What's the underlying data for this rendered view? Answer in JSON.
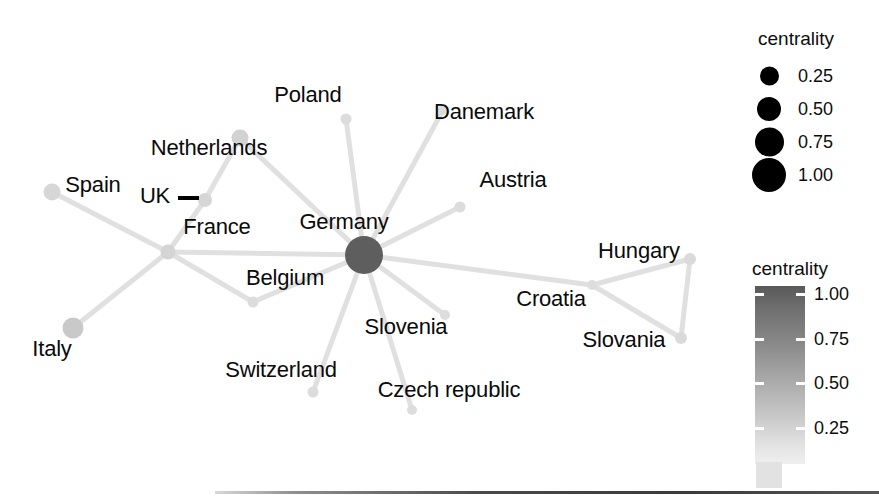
{
  "figure": {
    "type": "network-graph",
    "title": "",
    "background": "#ffffff"
  },
  "chart_data": {
    "type": "scatter",
    "subtype": "node-link-network",
    "title": "",
    "xlabel": "",
    "ylabel": "",
    "grid": false,
    "legend_position": "right",
    "encodings": {
      "node_size": "centrality",
      "node_color": "centrality"
    },
    "nodes": [
      {
        "id": "germany",
        "label": "Germany",
        "x": 364,
        "y": 255,
        "r": 19.0,
        "color": "#5e5e5e",
        "centrality": 1.0,
        "label_x": 344,
        "label_y": 222,
        "label_anchor": "middle"
      },
      {
        "id": "poland",
        "label": "Poland",
        "x": 346,
        "y": 119,
        "r": 5.5,
        "color": "#dcdcdc",
        "centrality": 0.15,
        "label_x": 308,
        "label_y": 95,
        "label_anchor": "middle"
      },
      {
        "id": "danemark",
        "label": "Danemark",
        "x": 443,
        "y": 110,
        "r": 5.0,
        "color": "#dddddd",
        "centrality": 0.13,
        "label_x": 484,
        "label_y": 112,
        "label_anchor": "middle"
      },
      {
        "id": "austria",
        "label": "Austria",
        "x": 460,
        "y": 207,
        "r": 5.5,
        "color": "#dcdcdc",
        "centrality": 0.15,
        "label_x": 513,
        "label_y": 180,
        "label_anchor": "middle"
      },
      {
        "id": "netherlands",
        "label": "Netherlands",
        "x": 240,
        "y": 138,
        "r": 8.5,
        "color": "#d2d2d2",
        "centrality": 0.26,
        "label_x": 209,
        "label_y": 148,
        "label_anchor": "middle"
      },
      {
        "id": "uk",
        "label": "UK",
        "x": 205,
        "y": 200,
        "r": 7.0,
        "color": "#d6d6d6",
        "centrality": 0.21,
        "label_x": 155,
        "label_y": 196,
        "label_anchor": "middle"
      },
      {
        "id": "france",
        "label": "France",
        "x": 168,
        "y": 252,
        "r": 7.5,
        "color": "#d4d4d4",
        "centrality": 0.23,
        "label_x": 217,
        "label_y": 227,
        "label_anchor": "middle"
      },
      {
        "id": "spain",
        "label": "Spain",
        "x": 52,
        "y": 192,
        "r": 8.5,
        "color": "#d6d6d6",
        "centrality": 0.22,
        "label_x": 93,
        "label_y": 185,
        "label_anchor": "middle"
      },
      {
        "id": "italy",
        "label": "Italy",
        "x": 73,
        "y": 328,
        "r": 10.5,
        "color": "#c9c9c9",
        "centrality": 0.31,
        "label_x": 52,
        "label_y": 349,
        "label_anchor": "middle"
      },
      {
        "id": "belgium",
        "label": "Belgium",
        "x": 253,
        "y": 302,
        "r": 5.5,
        "color": "#dcdcdc",
        "centrality": 0.15,
        "label_x": 285,
        "label_y": 278,
        "label_anchor": "middle"
      },
      {
        "id": "switzerland",
        "label": "Switzerland",
        "x": 313,
        "y": 392,
        "r": 5.5,
        "color": "#dcdcdc",
        "centrality": 0.15,
        "label_x": 281,
        "label_y": 370,
        "label_anchor": "middle"
      },
      {
        "id": "czech-republic",
        "label": "Czech republic",
        "x": 412,
        "y": 410,
        "r": 5.0,
        "color": "#dddddd",
        "centrality": 0.13,
        "label_x": 449,
        "label_y": 390,
        "label_anchor": "middle"
      },
      {
        "id": "slovenia",
        "label": "Slovenia",
        "x": 445,
        "y": 315,
        "r": 5.0,
        "color": "#dddddd",
        "centrality": 0.13,
        "label_x": 406,
        "label_y": 327,
        "label_anchor": "middle"
      },
      {
        "id": "croatia",
        "label": "Croatia",
        "x": 592,
        "y": 285,
        "r": 5.0,
        "color": "#dddddd",
        "centrality": 0.13,
        "label_x": 551,
        "label_y": 299,
        "label_anchor": "middle"
      },
      {
        "id": "hungary",
        "label": "Hungary",
        "x": 690,
        "y": 259,
        "r": 6.0,
        "color": "#dadada",
        "centrality": 0.17,
        "label_x": 639,
        "label_y": 251,
        "label_anchor": "middle"
      },
      {
        "id": "slovania",
        "label": "Slovania",
        "x": 681,
        "y": 338,
        "r": 6.0,
        "color": "#dadada",
        "centrality": 0.17,
        "label_x": 624,
        "label_y": 340,
        "label_anchor": "middle"
      }
    ],
    "edges": [
      {
        "source": "germany",
        "target": "poland"
      },
      {
        "source": "germany",
        "target": "danemark"
      },
      {
        "source": "germany",
        "target": "austria"
      },
      {
        "source": "germany",
        "target": "netherlands"
      },
      {
        "source": "germany",
        "target": "france"
      },
      {
        "source": "germany",
        "target": "belgium"
      },
      {
        "source": "germany",
        "target": "switzerland"
      },
      {
        "source": "germany",
        "target": "czech-republic"
      },
      {
        "source": "germany",
        "target": "slovenia"
      },
      {
        "source": "germany",
        "target": "croatia"
      },
      {
        "source": "netherlands",
        "target": "uk"
      },
      {
        "source": "uk",
        "target": "france"
      },
      {
        "source": "france",
        "target": "spain"
      },
      {
        "source": "france",
        "target": "italy"
      },
      {
        "source": "france",
        "target": "belgium"
      },
      {
        "source": "croatia",
        "target": "hungary"
      },
      {
        "source": "croatia",
        "target": "slovania"
      },
      {
        "source": "hungary",
        "target": "slovania"
      }
    ],
    "size_legend": {
      "title": "centrality",
      "entries": [
        {
          "value": "0.25",
          "diameter": 19
        },
        {
          "value": "0.50",
          "diameter": 24
        },
        {
          "value": "0.75",
          "diameter": 29
        },
        {
          "value": "1.00",
          "diameter": 34
        }
      ]
    },
    "colorbar": {
      "title": "centrality",
      "ticks": [
        "1.00",
        "0.75",
        "0.50",
        "0.25"
      ],
      "range": [
        0.25,
        1.0
      ],
      "orientation": "vertical",
      "color_high": "#595959",
      "color_low": "#efefef"
    }
  }
}
